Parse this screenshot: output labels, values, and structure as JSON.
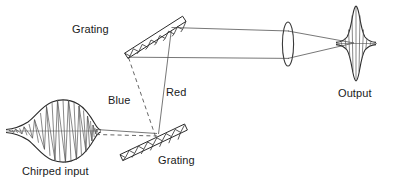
{
  "figure": {
    "kind": "optical-diagram",
    "background_color": "#ffffff",
    "ink_color": "#2b2b2b"
  },
  "labels": {
    "chirped_input": "Chirped input",
    "grating_top": "Grating",
    "grating_bottom": "Grating",
    "blue": "Blue",
    "red": "Red",
    "output": "Output"
  },
  "components": {
    "input_pulse": {
      "name": "chirped-input-pulse",
      "center_x": 68,
      "center_y": 131,
      "half_width": 62,
      "half_height": 31,
      "oscillation_count": 17,
      "chirp": "frequency varies across the envelope"
    },
    "grating_top": {
      "name": "top-grating",
      "x1": 126,
      "y1": 56,
      "x2": 184,
      "y2": 19,
      "thickness": 7,
      "hatch_segments": 13
    },
    "grating_bottom": {
      "name": "bottom-grating",
      "x1": 121,
      "y1": 158,
      "x2": 186,
      "y2": 127,
      "thickness": 7,
      "hatch_segments": 14
    },
    "lens": {
      "name": "focusing-lens",
      "center_x": 288,
      "center_y": 44,
      "rx": 5.5,
      "ry": 22
    },
    "output_pulse": {
      "name": "output-pulse",
      "center_x": 356,
      "center_y": 43,
      "half_width": 20,
      "half_height": 37,
      "oscillation_count": 7
    }
  },
  "rays": {
    "input_beam": {
      "name": "input-beam",
      "style": "solid",
      "from_x": 96,
      "from_y": 129,
      "to_x": 156,
      "to_y": 134
    },
    "input_beam_dashed": {
      "name": "input-beam-dashed",
      "style": "dashed",
      "from_x": 96,
      "from_y": 134,
      "to_x": 156,
      "to_y": 136
    },
    "blue_ray": {
      "name": "blue-ray",
      "style": "dashed",
      "from_x": 155,
      "from_y": 135,
      "to_x": 128,
      "to_y": 57,
      "color_label": "Blue"
    },
    "red_ray": {
      "name": "red-ray",
      "style": "solid",
      "from_x": 158,
      "from_y": 133,
      "to_x": 172,
      "to_y": 24,
      "color_label": "Red"
    },
    "collimated_top": {
      "name": "collimated-ray-upper",
      "style": "solid",
      "from_x": 172,
      "from_y": 28,
      "to_x": 288,
      "to_y": 31
    },
    "collimated_bottom": {
      "name": "collimated-ray-lower",
      "style": "solid",
      "from_x": 130,
      "from_y": 57,
      "to_x": 288,
      "to_y": 58
    },
    "converging_top": {
      "name": "converging-ray-upper",
      "style": "solid",
      "from_x": 288,
      "from_y": 31,
      "to_x": 353,
      "to_y": 43
    },
    "converging_bottom": {
      "name": "converging-ray-lower",
      "style": "solid",
      "from_x": 288,
      "from_y": 58,
      "to_x": 353,
      "to_y": 43
    }
  },
  "label_positions": {
    "chirped_input": {
      "x": 22,
      "y": 175
    },
    "grating_top": {
      "x": 72,
      "y": 33
    },
    "grating_bottom": {
      "x": 158,
      "y": 164
    },
    "blue": {
      "x": 108,
      "y": 104
    },
    "red": {
      "x": 166,
      "y": 96
    },
    "output": {
      "x": 338,
      "y": 97
    }
  }
}
